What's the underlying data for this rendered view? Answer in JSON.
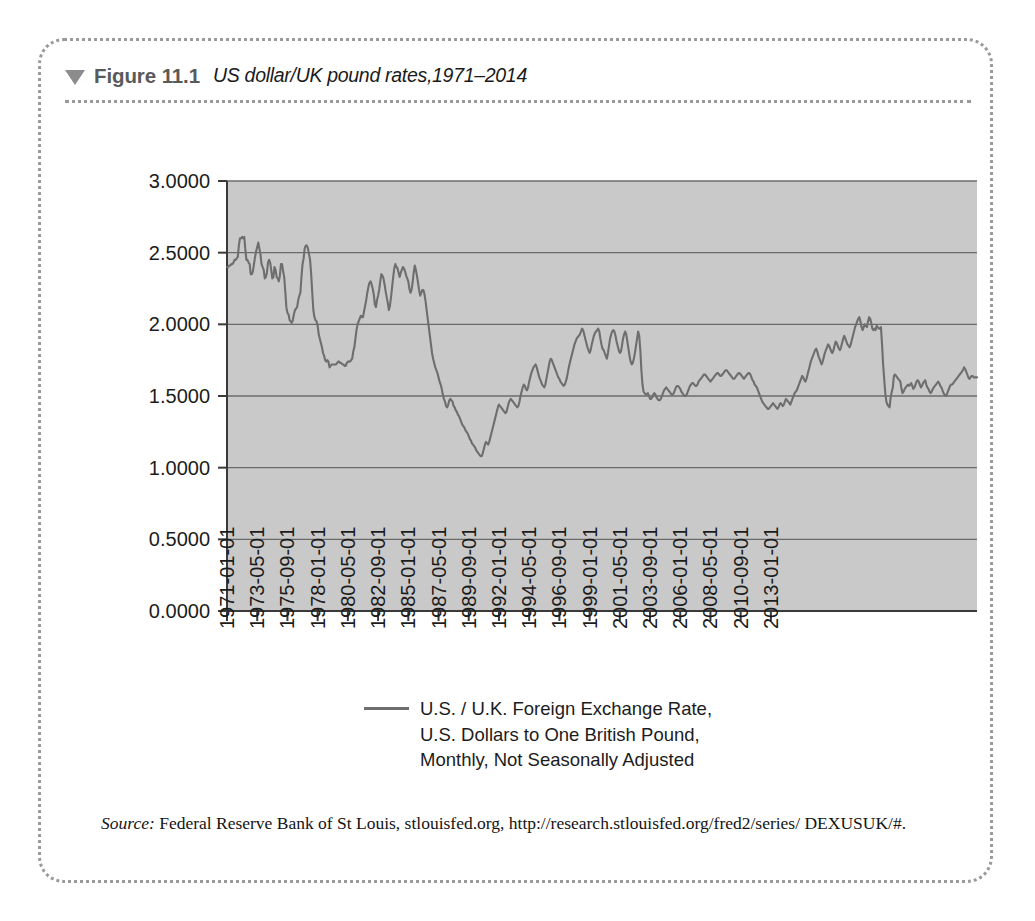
{
  "figure": {
    "marker_icon": "triangle-down-icon",
    "number_label": "Figure 11.1",
    "title": "US dollar/UK pound rates,1971–2014"
  },
  "legend": {
    "line1": "U.S. / U.K. Foreign Exchange Rate,",
    "line2": "U.S. Dollars to One British Pound,",
    "line3": "Monthly, Not Seasonally Adjusted"
  },
  "source": {
    "label": "Source:",
    "text": " Federal Reserve Bank of St Louis, stlouisfed.org, http://research.stlouisfed.org/fred2/series/ DEXUSUK/#."
  },
  "colors": {
    "plot_background": "#c9c9c9",
    "series_line": "#6e6e6e",
    "gridline": "#6b6b6b",
    "axis": "#3a3a3a",
    "border_dotted": "#9a9a9a",
    "figure_label": "#5a5a5a"
  },
  "chart_data": {
    "type": "line",
    "title": "US dollar/UK pound rates,1971–2014",
    "xlabel": "",
    "ylabel": "",
    "ylim": [
      0.0,
      3.0
    ],
    "yticks": [
      0.0,
      0.5,
      1.0,
      1.5,
      2.0,
      2.5,
      3.0
    ],
    "ytick_labels": [
      "0.0000",
      "0.5000",
      "1.0000",
      "1.5000",
      "2.0000",
      "2.5000",
      "3.0000"
    ],
    "grid": true,
    "legend_position": "below-center",
    "xtick_labels": [
      "1971-01-01",
      "1973-05-01",
      "1975-09-01",
      "1978-01-01",
      "1980-05-01",
      "1982-09-01",
      "1985-01-01",
      "1987-05-01",
      "1989-09-01",
      "1992-01-01",
      "1994-05-01",
      "1996-09-01",
      "1999-01-01",
      "2001-05-01",
      "2003-09-01",
      "2006-01-01",
      "2008-05-01",
      "2010-09-01",
      "2013-01-01"
    ],
    "xtick_index": [
      0,
      28,
      56,
      84,
      112,
      140,
      168,
      196,
      224,
      252,
      280,
      308,
      336,
      364,
      392,
      420,
      448,
      476,
      504
    ],
    "x_start": "1971-01-01",
    "x_end": "2014-12-01",
    "x_interval": "monthly",
    "n_points": 528,
    "series": [
      {
        "name": "U.S. / U.K. Foreign Exchange Rate, U.S. Dollars to One British Pound, Monthly, Not Seasonally Adjusted",
        "color": "#6e6e6e",
        "values": [
          2.4,
          2.4,
          2.41,
          2.41,
          2.42,
          2.42,
          2.43,
          2.45,
          2.45,
          2.46,
          2.47,
          2.55,
          2.6,
          2.6,
          2.61,
          2.6,
          2.61,
          2.52,
          2.45,
          2.45,
          2.43,
          2.42,
          2.35,
          2.35,
          2.37,
          2.42,
          2.47,
          2.51,
          2.54,
          2.57,
          2.53,
          2.49,
          2.42,
          2.4,
          2.38,
          2.32,
          2.33,
          2.36,
          2.43,
          2.45,
          2.43,
          2.38,
          2.32,
          2.33,
          2.4,
          2.38,
          2.33,
          2.32,
          2.3,
          2.34,
          2.42,
          2.42,
          2.37,
          2.33,
          2.23,
          2.12,
          2.08,
          2.07,
          2.03,
          2.02,
          2.01,
          2.03,
          2.07,
          2.1,
          2.11,
          2.12,
          2.17,
          2.2,
          2.22,
          2.33,
          2.42,
          2.46,
          2.53,
          2.55,
          2.55,
          2.53,
          2.49,
          2.45,
          2.35,
          2.22,
          2.1,
          2.05,
          2.03,
          2.02,
          1.99,
          1.93,
          1.9,
          1.87,
          1.84,
          1.8,
          1.78,
          1.75,
          1.74,
          1.75,
          1.74,
          1.7,
          1.71,
          1.72,
          1.72,
          1.72,
          1.72,
          1.72,
          1.73,
          1.74,
          1.74,
          1.73,
          1.73,
          1.72,
          1.72,
          1.71,
          1.71,
          1.73,
          1.74,
          1.74,
          1.74,
          1.75,
          1.76,
          1.81,
          1.84,
          1.9,
          1.96,
          2.0,
          2.02,
          2.04,
          2.06,
          2.05,
          2.05,
          2.09,
          2.13,
          2.17,
          2.22,
          2.26,
          2.29,
          2.3,
          2.28,
          2.25,
          2.21,
          2.14,
          2.12,
          2.17,
          2.2,
          2.24,
          2.3,
          2.35,
          2.34,
          2.32,
          2.28,
          2.23,
          2.19,
          2.15,
          2.1,
          2.13,
          2.19,
          2.26,
          2.33,
          2.39,
          2.42,
          2.4,
          2.39,
          2.36,
          2.33,
          2.36,
          2.38,
          2.4,
          2.39,
          2.37,
          2.34,
          2.32,
          2.3,
          2.25,
          2.22,
          2.24,
          2.29,
          2.36,
          2.41,
          2.38,
          2.34,
          2.29,
          2.24,
          2.2,
          2.22,
          2.24,
          2.24,
          2.21,
          2.16,
          2.1,
          2.04,
          1.98,
          1.92,
          1.86,
          1.8,
          1.76,
          1.73,
          1.7,
          1.68,
          1.66,
          1.63,
          1.6,
          1.58,
          1.55,
          1.51,
          1.48,
          1.46,
          1.43,
          1.42,
          1.44,
          1.47,
          1.48,
          1.47,
          1.46,
          1.43,
          1.42,
          1.4,
          1.39,
          1.37,
          1.36,
          1.34,
          1.32,
          1.3,
          1.29,
          1.28,
          1.26,
          1.25,
          1.24,
          1.22,
          1.2,
          1.19,
          1.17,
          1.16,
          1.15,
          1.14,
          1.12,
          1.11,
          1.1,
          1.09,
          1.08,
          1.08,
          1.1,
          1.13,
          1.16,
          1.18,
          1.17,
          1.16,
          1.18,
          1.21,
          1.24,
          1.27,
          1.3,
          1.33,
          1.36,
          1.39,
          1.42,
          1.44,
          1.43,
          1.42,
          1.41,
          1.4,
          1.39,
          1.38,
          1.39,
          1.42,
          1.45,
          1.47,
          1.48,
          1.47,
          1.46,
          1.45,
          1.44,
          1.43,
          1.42,
          1.43,
          1.46,
          1.5,
          1.53,
          1.56,
          1.58,
          1.57,
          1.55,
          1.54,
          1.56,
          1.6,
          1.63,
          1.66,
          1.68,
          1.7,
          1.71,
          1.72,
          1.7,
          1.67,
          1.64,
          1.62,
          1.6,
          1.58,
          1.57,
          1.56,
          1.58,
          1.62,
          1.66,
          1.7,
          1.74,
          1.76,
          1.75,
          1.73,
          1.71,
          1.69,
          1.67,
          1.65,
          1.63,
          1.62,
          1.6,
          1.59,
          1.58,
          1.57,
          1.58,
          1.6,
          1.63,
          1.67,
          1.71,
          1.74,
          1.77,
          1.8,
          1.83,
          1.86,
          1.88,
          1.9,
          1.91,
          1.92,
          1.93,
          1.95,
          1.97,
          1.96,
          1.93,
          1.9,
          1.87,
          1.84,
          1.82,
          1.8,
          1.82,
          1.86,
          1.89,
          1.92,
          1.94,
          1.95,
          1.96,
          1.97,
          1.95,
          1.9,
          1.86,
          1.83,
          1.82,
          1.8,
          1.78,
          1.76,
          1.8,
          1.85,
          1.9,
          1.93,
          1.95,
          1.96,
          1.95,
          1.92,
          1.88,
          1.85,
          1.82,
          1.8,
          1.81,
          1.85,
          1.9,
          1.93,
          1.95,
          1.93,
          1.88,
          1.83,
          1.78,
          1.74,
          1.72,
          1.73,
          1.76,
          1.8,
          1.85,
          1.9,
          1.95,
          1.92,
          1.82,
          1.68,
          1.58,
          1.53,
          1.52,
          1.51,
          1.51,
          1.52,
          1.5,
          1.48,
          1.48,
          1.49,
          1.51,
          1.52,
          1.51,
          1.49,
          1.48,
          1.47,
          1.47,
          1.48,
          1.5,
          1.52,
          1.54,
          1.55,
          1.56,
          1.55,
          1.54,
          1.53,
          1.52,
          1.51,
          1.51,
          1.52,
          1.54,
          1.56,
          1.57,
          1.57,
          1.56,
          1.55,
          1.53,
          1.52,
          1.51,
          1.5,
          1.5,
          1.51,
          1.53,
          1.55,
          1.57,
          1.58,
          1.59,
          1.59,
          1.58,
          1.57,
          1.57,
          1.58,
          1.6,
          1.61,
          1.62,
          1.63,
          1.64,
          1.65,
          1.65,
          1.64,
          1.63,
          1.62,
          1.61,
          1.6,
          1.61,
          1.62,
          1.63,
          1.64,
          1.65,
          1.66,
          1.66,
          1.65,
          1.64,
          1.64,
          1.65,
          1.66,
          1.67,
          1.68,
          1.68,
          1.67,
          1.66,
          1.65,
          1.64,
          1.63,
          1.62,
          1.62,
          1.63,
          1.64,
          1.65,
          1.66,
          1.66,
          1.65,
          1.64,
          1.63,
          1.62,
          1.63,
          1.64,
          1.65,
          1.66,
          1.66,
          1.65,
          1.63,
          1.61,
          1.6,
          1.58,
          1.57,
          1.56,
          1.54,
          1.52,
          1.5,
          1.48,
          1.46,
          1.45,
          1.44,
          1.43,
          1.42,
          1.41,
          1.41,
          1.42,
          1.43,
          1.44,
          1.45,
          1.44,
          1.43,
          1.42,
          1.41,
          1.42,
          1.44,
          1.45,
          1.44,
          1.43,
          1.44,
          1.46,
          1.48,
          1.47,
          1.46,
          1.45,
          1.44,
          1.46,
          1.48,
          1.5,
          1.52,
          1.53,
          1.54,
          1.56,
          1.58,
          1.6,
          1.62,
          1.64,
          1.63,
          1.61,
          1.6,
          1.62,
          1.65,
          1.68,
          1.71,
          1.74,
          1.76,
          1.78,
          1.8,
          1.82,
          1.83,
          1.81,
          1.78,
          1.76,
          1.74,
          1.72,
          1.74,
          1.77,
          1.8,
          1.82,
          1.84,
          1.86,
          1.85,
          1.83,
          1.81,
          1.8,
          1.82,
          1.85,
          1.88,
          1.87,
          1.85,
          1.83,
          1.82,
          1.84,
          1.87,
          1.9,
          1.92,
          1.9,
          1.88,
          1.86,
          1.85,
          1.84,
          1.86,
          1.89,
          1.92,
          1.95,
          1.98,
          2.0,
          2.02,
          2.04,
          2.05,
          2.02,
          1.98,
          1.96,
          1.98,
          2.0,
          1.99,
          1.98,
          2.02,
          2.05,
          2.04,
          2.01,
          1.97,
          1.96,
          1.97,
          1.96,
          1.99,
          1.98,
          1.97,
          1.97,
          1.98,
          1.86,
          1.72,
          1.62,
          1.52,
          1.46,
          1.44,
          1.43,
          1.42,
          1.49,
          1.53,
          1.56,
          1.64,
          1.65,
          1.64,
          1.63,
          1.62,
          1.61,
          1.6,
          1.55,
          1.52,
          1.53,
          1.55,
          1.56,
          1.57,
          1.58,
          1.57,
          1.58,
          1.59,
          1.57,
          1.55,
          1.56,
          1.58,
          1.6,
          1.61,
          1.6,
          1.58,
          1.56,
          1.57,
          1.59,
          1.6,
          1.61,
          1.58,
          1.56,
          1.55,
          1.53,
          1.52,
          1.53,
          1.55,
          1.56,
          1.57,
          1.58,
          1.59,
          1.6,
          1.59,
          1.57,
          1.56,
          1.54,
          1.52,
          1.51,
          1.5,
          1.51,
          1.53,
          1.55,
          1.57,
          1.58,
          1.58,
          1.59,
          1.6,
          1.61,
          1.62,
          1.63,
          1.64,
          1.65,
          1.66,
          1.67,
          1.68,
          1.7,
          1.69,
          1.67,
          1.65,
          1.63,
          1.62,
          1.63,
          1.64,
          1.64,
          1.63,
          1.63,
          1.63,
          1.63
        ]
      }
    ]
  }
}
